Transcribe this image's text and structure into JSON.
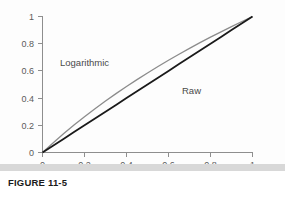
{
  "figure": {
    "caption": "FIGURE 11-5"
  },
  "chart_data": {
    "type": "line",
    "title": "",
    "xlabel": "",
    "ylabel": "",
    "xlim": [
      0,
      1
    ],
    "ylim": [
      0,
      1
    ],
    "grid": false,
    "legend_position": "inline-annotation",
    "x_ticks": [
      "0",
      "0.2",
      "0.4",
      "0.6",
      "0.8",
      "1"
    ],
    "x_tick_values": [
      0,
      0.2,
      0.4,
      0.6,
      0.8,
      1
    ],
    "y_ticks": [
      "0",
      "0.2",
      "0.4",
      "0.6",
      "0.8",
      "1"
    ],
    "y_tick_values": [
      0,
      0.2,
      0.4,
      0.6,
      0.8,
      1
    ],
    "x": [
      0,
      0.05,
      0.1,
      0.15,
      0.2,
      0.25,
      0.3,
      0.35,
      0.4,
      0.45,
      0.5,
      0.55,
      0.6,
      0.65,
      0.7,
      0.75,
      0.8,
      0.85,
      0.9,
      0.95,
      1
    ],
    "series": [
      {
        "name": "Logarithmic",
        "color": "#8c8c8c",
        "values": [
          0,
          0.0704,
          0.1375,
          0.2016,
          0.263,
          0.3219,
          0.3785,
          0.433,
          0.4854,
          0.5361,
          0.585,
          0.6322,
          0.6781,
          0.7225,
          0.7655,
          0.8074,
          0.848,
          0.8875,
          0.926,
          0.9634,
          1
        ]
      },
      {
        "name": "Raw",
        "color": "#1a1a1a",
        "values": [
          0,
          0.05,
          0.1,
          0.15,
          0.2,
          0.25,
          0.3,
          0.35,
          0.4,
          0.45,
          0.5,
          0.55,
          0.6,
          0.65,
          0.7,
          0.75,
          0.8,
          0.85,
          0.9,
          0.95,
          1
        ]
      }
    ],
    "annotations": [
      {
        "text": "Logarithmic",
        "x": 0.15,
        "y": 0.66
      },
      {
        "text": "Raw",
        "x": 0.58,
        "y": 0.44
      }
    ],
    "colors": {
      "axis": "#8e8e8e",
      "logarithmic": "#8c8c8c",
      "raw": "#1a1a1a",
      "tick_text": "#5b5b5b",
      "caption_text": "#1b1b1b",
      "bottom_bar": "#d8d8d8"
    }
  }
}
